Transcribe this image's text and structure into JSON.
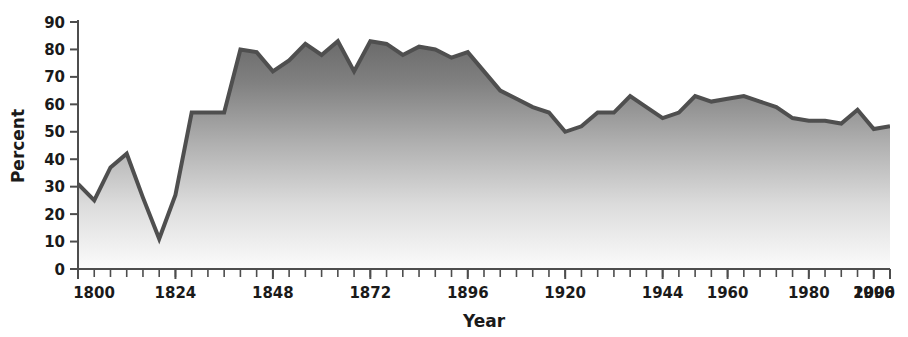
{
  "chart_data": {
    "type": "area",
    "title": "",
    "subtitle": "",
    "xlabel": "Year",
    "ylabel": "Percent",
    "xlim": [
      1800,
      2000
    ],
    "ylim": [
      0,
      90
    ],
    "y_ticks": [
      0,
      10,
      20,
      30,
      40,
      50,
      60,
      70,
      80,
      90
    ],
    "x_tick_labels": [
      "1800",
      "1824",
      "1848",
      "1872",
      "1896",
      "1920",
      "1944",
      "1960",
      "1980",
      "1996",
      "2000"
    ],
    "x_tick_label_years": [
      1800,
      1824,
      1848,
      1872,
      1896,
      1920,
      1944,
      1960,
      1980,
      1996,
      2000
    ],
    "x_minor_tick_interval": 4,
    "grid": false,
    "legend": null,
    "legend_position": "none",
    "series": [
      {
        "name": "Percent",
        "color": "#4f4f4f",
        "fill_top_color": "#6b6b6b",
        "fill_bottom_color": "#fbfbfb",
        "x": [
          1800,
          1804,
          1808,
          1812,
          1816,
          1820,
          1824,
          1828,
          1832,
          1836,
          1840,
          1844,
          1848,
          1852,
          1856,
          1860,
          1864,
          1868,
          1872,
          1876,
          1880,
          1884,
          1888,
          1892,
          1896,
          1900,
          1904,
          1908,
          1912,
          1916,
          1920,
          1924,
          1928,
          1932,
          1936,
          1940,
          1944,
          1948,
          1952,
          1956,
          1960,
          1964,
          1968,
          1972,
          1976,
          1980,
          1984,
          1988,
          1992,
          1996,
          2000
        ],
        "values": [
          31,
          25,
          37,
          42,
          26,
          11,
          27,
          57,
          57,
          57,
          80,
          79,
          72,
          76,
          82,
          78,
          83,
          72,
          83,
          82,
          78,
          81,
          80,
          77,
          79,
          72,
          65,
          62,
          59,
          57,
          50,
          52,
          57,
          57,
          63,
          59,
          55,
          57,
          63,
          61,
          62,
          63,
          61,
          59,
          55,
          54,
          54,
          53,
          58,
          51,
          52
        ]
      }
    ],
    "annotations": []
  },
  "axis": {
    "ylabel": "Percent",
    "xlabel": "Year"
  }
}
